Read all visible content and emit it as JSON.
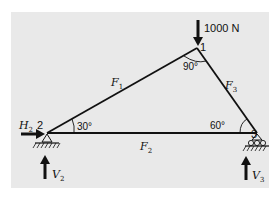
{
  "diagram": {
    "type": "truss",
    "nodes": [
      {
        "id": "1",
        "label": "1"
      },
      {
        "id": "2",
        "label": "2"
      },
      {
        "id": "3",
        "label": "3"
      }
    ],
    "members": [
      {
        "id": "F1",
        "label": "F",
        "sub": "1"
      },
      {
        "id": "F2",
        "label": "F",
        "sub": "2"
      },
      {
        "id": "F3",
        "label": "F",
        "sub": "3"
      }
    ],
    "angles": {
      "node1": "90°",
      "node2": "30°",
      "node3": "60°"
    },
    "loads": {
      "applied": "1000 N",
      "H2": {
        "label": "H",
        "sub": "2"
      },
      "V2": {
        "label": "V",
        "sub": "2"
      },
      "V3": {
        "label": "V",
        "sub": "3"
      }
    },
    "colors": {
      "background": "#e9e9e9",
      "line": "#111111"
    }
  }
}
